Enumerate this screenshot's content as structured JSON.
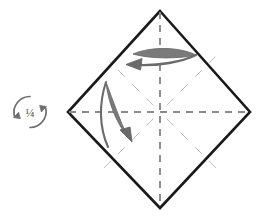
{
  "figure": {
    "kind": "origami-instruction-diagram",
    "background_color": "#ffffff",
    "width": 265,
    "height": 218,
    "title": "Origami step: rotate one quarter turn and fold flaps"
  },
  "rotation_symbol": {
    "label": "¼",
    "name": "quarter-turn",
    "color": "#6e6e6e",
    "center_x": 30,
    "center_y": 112,
    "radius": 16,
    "description": "Two circular arrows encircling the fraction one quarter"
  },
  "paper": {
    "name": "square-rotated-45",
    "stroke_color": "#1a1a1a",
    "stroke_width": 2.6,
    "fill": "#ffffff",
    "vertices": {
      "top": [
        160,
        11
      ],
      "right": [
        250,
        112
      ],
      "bottom": [
        160,
        208
      ],
      "left": [
        68,
        112
      ]
    }
  },
  "creases": {
    "primary_color": "#8a8a8a",
    "secondary_color": "#bdbdbd",
    "primary_dash": "7 6",
    "secondary_dash": "9 11",
    "lines": [
      {
        "name": "vertical-center-crease",
        "from": [
          160,
          11
        ],
        "to": [
          160,
          208
        ],
        "weight": "primary"
      },
      {
        "name": "horizontal-center-crease",
        "from": [
          68,
          112
        ],
        "to": [
          250,
          112
        ],
        "weight": "primary"
      },
      {
        "name": "diagonal-crease-upper-right",
        "from": [
          166,
          106
        ],
        "to": [
          212,
          60
        ],
        "weight": "secondary"
      },
      {
        "name": "diagonal-crease-upper-left",
        "from": [
          154,
          106
        ],
        "to": [
          112,
          64
        ],
        "weight": "secondary"
      },
      {
        "name": "diagonal-crease-lower-left",
        "from": [
          154,
          118
        ],
        "to": [
          104,
          168
        ],
        "weight": "secondary"
      },
      {
        "name": "diagonal-crease-lower-right",
        "from": [
          166,
          118
        ],
        "to": [
          215,
          167
        ],
        "weight": "secondary"
      }
    ]
  },
  "arrows": [
    {
      "name": "fold-arrow-top",
      "direction": "left",
      "color": "#6b6b6b",
      "description": "Flat lens-shaped fold arrow across the top quadrant pointing left"
    },
    {
      "name": "fold-arrow-left",
      "direction": "down-right",
      "color": "#6b6b6b",
      "description": "Narrow lens-shaped fold arrow in the left quadrant pointing down and right"
    }
  ]
}
